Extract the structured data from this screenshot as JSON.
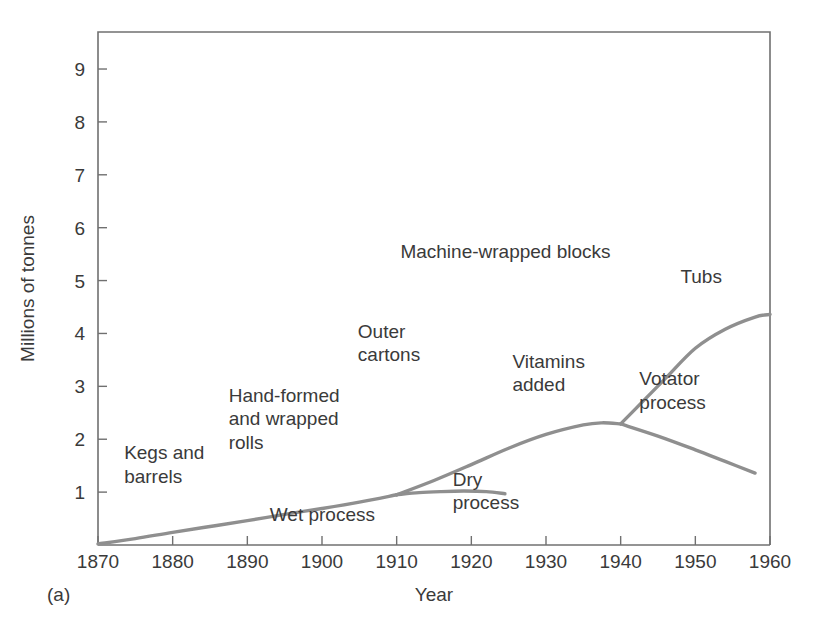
{
  "figure": {
    "panel_label": "(a)",
    "background_color": "#ffffff",
    "line_color": "#8f8f8f",
    "axis_color": "#707070",
    "text_color": "#3a3a3a"
  },
  "chart_data": {
    "type": "line",
    "title": "",
    "subtitle": "",
    "xlabel": "Year",
    "ylabel": "Millions of tonnes",
    "xlim": [
      1870,
      1960
    ],
    "ylim": [
      0,
      9.7
    ],
    "grid": false,
    "legend_position": "none",
    "xticks": [
      1870,
      1880,
      1890,
      1900,
      1910,
      1920,
      1930,
      1940,
      1950,
      1960
    ],
    "xtick_labels": [
      "1870",
      "1880",
      "1890",
      "1900",
      "1910",
      "1920",
      "1930",
      "1940",
      "1950",
      "1960"
    ],
    "yticks": [
      1,
      2,
      3,
      4,
      5,
      6,
      7,
      8,
      9
    ],
    "ytick_labels": [
      "1",
      "2",
      "3",
      "4",
      "5",
      "6",
      "7",
      "8",
      "9"
    ],
    "series": [
      {
        "name": "Main production trunk",
        "x": [
          1870,
          1875,
          1880,
          1885,
          1890,
          1895,
          1900,
          1905,
          1910
        ],
        "values": [
          0.02,
          0.12,
          0.24,
          0.35,
          0.46,
          0.58,
          0.69,
          0.81,
          0.95
        ]
      },
      {
        "name": "Dry process branch",
        "x": [
          1910,
          1913,
          1916,
          1919,
          1922,
          1924.5
        ],
        "values": [
          0.95,
          0.99,
          1.01,
          1.02,
          1.01,
          0.97
        ]
      },
      {
        "name": "Machine-wrapped / vitamins trunk",
        "x": [
          1910,
          1915,
          1920,
          1925,
          1930,
          1935,
          1937.5,
          1940
        ],
        "values": [
          0.95,
          1.22,
          1.52,
          1.83,
          2.09,
          2.27,
          2.31,
          2.29
        ]
      },
      {
        "name": "Votator process branch",
        "x": [
          1940,
          1945,
          1950,
          1954,
          1958
        ],
        "values": [
          2.29,
          2.06,
          1.8,
          1.58,
          1.36
        ]
      },
      {
        "name": "Tubs branch",
        "x": [
          1940,
          1943,
          1946,
          1950,
          1954,
          1958,
          1960
        ],
        "values": [
          2.29,
          2.72,
          3.15,
          3.72,
          4.08,
          4.31,
          4.36
        ]
      }
    ],
    "annotations": [
      {
        "text": "Kegs and",
        "x": 1873.5,
        "y": 1.62
      },
      {
        "text": "barrels",
        "x": 1873.5,
        "y": 1.18
      },
      {
        "text": "Hand-formed",
        "x": 1887.5,
        "y": 2.7
      },
      {
        "text": "and wrapped",
        "x": 1887.5,
        "y": 2.26
      },
      {
        "text": "rolls",
        "x": 1887.5,
        "y": 1.82
      },
      {
        "text": "Wet process",
        "x": 1893.0,
        "y": 0.46
      },
      {
        "text": "Outer",
        "x": 1904.8,
        "y": 3.92
      },
      {
        "text": "cartons",
        "x": 1904.8,
        "y": 3.48
      },
      {
        "text": "Machine-wrapped blocks",
        "x": 1910.5,
        "y": 5.42
      },
      {
        "text": "Dry",
        "x": 1917.5,
        "y": 1.12
      },
      {
        "text": "process",
        "x": 1917.5,
        "y": 0.68
      },
      {
        "text": "Vitamins",
        "x": 1925.5,
        "y": 3.35
      },
      {
        "text": "added",
        "x": 1925.5,
        "y": 2.91
      },
      {
        "text": "Votator",
        "x": 1942.5,
        "y": 3.02
      },
      {
        "text": "process",
        "x": 1942.5,
        "y": 2.58
      },
      {
        "text": "Tubs",
        "x": 1948.0,
        "y": 4.96
      }
    ]
  }
}
